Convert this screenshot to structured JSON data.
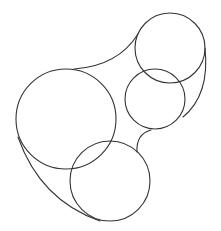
{
  "diagram": {
    "type": "circle-hull",
    "width": 221,
    "height": 231,
    "background": "#ffffff",
    "stroke_color": "#333333",
    "circles": [
      {
        "name": "large-left-circle",
        "cx": 66,
        "cy": 119,
        "r": 50
      },
      {
        "name": "top-right-circle",
        "cx": 170,
        "cy": 48,
        "r": 35
      },
      {
        "name": "middle-right-circle",
        "cx": 155,
        "cy": 99,
        "r": 30
      },
      {
        "name": "bottom-circle",
        "cx": 110,
        "cy": 181,
        "r": 40
      }
    ],
    "hull_arcs": [
      {
        "name": "hull-top-arc",
        "d": "M 74 69 Q 118 66 138 34"
      },
      {
        "name": "hull-right-arc",
        "d": "M 205 48 Q 210 95 183 117"
      },
      {
        "name": "hull-inner-notch-arc",
        "d": "M 151 130 Q 136 134 137 152"
      },
      {
        "name": "hull-lower-left-arc",
        "d": "M 18 137 Q 40 200 100 221"
      }
    ]
  }
}
